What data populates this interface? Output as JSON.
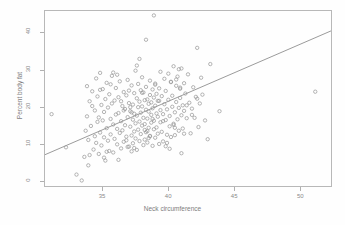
{
  "chart_data": {
    "type": "scatter",
    "title": "",
    "xlabel": "Neck circumference",
    "ylabel": "Percent body fat",
    "xlim": [
      30.6,
      52.4
    ],
    "ylim": [
      -1.5,
      46.0
    ],
    "xticks": [
      35,
      40,
      45,
      50
    ],
    "yticks": [
      0,
      10,
      20,
      30,
      40
    ],
    "grid": false,
    "legend": null,
    "point_style": {
      "marker": "open-circle",
      "radius": 1.7,
      "color": "#9a9a9a",
      "fill": "none"
    },
    "fit_line": {
      "type": "linear-regression",
      "color": "#808080",
      "width": 0.8,
      "x_start": 30.6,
      "y_start": 7.0,
      "x_end": 52.4,
      "y_end": 40.6
    },
    "x": [
      31.1,
      32.2,
      33.0,
      33.4,
      33.6,
      33.7,
      33.8,
      33.8,
      33.9,
      34.0,
      34.0,
      34.1,
      34.2,
      34.3,
      34.4,
      34.4,
      34.5,
      34.5,
      34.6,
      34.6,
      34.7,
      34.7,
      34.8,
      34.8,
      34.9,
      34.9,
      35.0,
      35.0,
      35.1,
      35.1,
      35.2,
      35.2,
      35.3,
      35.3,
      35.4,
      35.4,
      35.5,
      35.5,
      35.6,
      35.6,
      35.7,
      35.7,
      35.8,
      35.8,
      35.9,
      35.9,
      36.0,
      36.0,
      36.1,
      36.1,
      36.2,
      36.2,
      36.3,
      36.3,
      36.4,
      36.4,
      36.5,
      36.5,
      36.6,
      36.6,
      36.7,
      36.7,
      36.8,
      36.8,
      36.9,
      36.9,
      37.0,
      37.0,
      37.1,
      37.1,
      37.2,
      37.2,
      37.2,
      37.3,
      37.3,
      37.3,
      37.4,
      37.4,
      37.4,
      37.5,
      37.5,
      37.5,
      37.6,
      37.6,
      37.6,
      37.7,
      37.7,
      37.7,
      37.8,
      37.8,
      37.8,
      37.9,
      37.9,
      37.9,
      38.0,
      38.0,
      38.0,
      38.1,
      38.1,
      38.1,
      38.2,
      38.2,
      38.2,
      38.3,
      38.3,
      38.3,
      38.4,
      38.4,
      38.4,
      38.5,
      38.5,
      38.5,
      38.6,
      38.6,
      38.6,
      38.7,
      38.7,
      38.7,
      38.8,
      38.8,
      38.8,
      38.9,
      38.9,
      38.9,
      39.0,
      39.0,
      39.0,
      39.1,
      39.1,
      39.1,
      39.2,
      39.2,
      39.2,
      39.3,
      39.3,
      39.4,
      39.4,
      39.5,
      39.5,
      39.6,
      39.6,
      39.7,
      39.7,
      39.8,
      39.8,
      39.9,
      39.9,
      40.0,
      40.0,
      40.1,
      40.1,
      40.2,
      40.2,
      40.3,
      40.3,
      40.4,
      40.4,
      40.5,
      40.5,
      40.6,
      40.6,
      40.7,
      40.7,
      40.8,
      40.8,
      40.9,
      40.9,
      41.0,
      41.0,
      41.1,
      41.1,
      41.2,
      41.2,
      41.3,
      41.4,
      41.5,
      41.6,
      41.7,
      41.8,
      41.9,
      42.0,
      42.1,
      42.2,
      42.3,
      42.4,
      42.5,
      42.6,
      42.8,
      43.0,
      43.2,
      43.9,
      51.2,
      34.2,
      35.6,
      36.4,
      37.1,
      37.8,
      38.3,
      38.9,
      39.4,
      40.2,
      40.8,
      36.2,
      37.4,
      38.6,
      39.8,
      41.0,
      35.1,
      36.8,
      38.2,
      39.6,
      40.5,
      33.9,
      35.3,
      36.9,
      38.5,
      40.1,
      41.4,
      34.8,
      36.1,
      37.6,
      39.0,
      40.4,
      41.8,
      36.6,
      38.0,
      39.3,
      40.9,
      42.2,
      37.2,
      38.8,
      40.6,
      35.8,
      37.0,
      38.4,
      39.9,
      41.2
    ],
    "y": [
      18.0,
      9.0,
      1.6,
      0.0,
      6.4,
      13.5,
      25.6,
      17.4,
      11.0,
      21.5,
      6.9,
      14.8,
      24.2,
      8.4,
      19.0,
      12.0,
      27.7,
      10.2,
      15.9,
      22.8,
      7.2,
      17.1,
      29.2,
      13.0,
      20.5,
      9.5,
      16.3,
      24.8,
      11.7,
      18.6,
      5.4,
      22.1,
      14.2,
      26.5,
      10.8,
      19.8,
      8.0,
      23.4,
      16.7,
      12.5,
      20.9,
      28.4,
      7.6,
      15.2,
      21.7,
      11.3,
      17.9,
      25.1,
      9.8,
      14.0,
      22.6,
      18.3,
      12.9,
      26.9,
      8.7,
      16.1,
      20.2,
      13.6,
      24.0,
      10.5,
      19.4,
      15.0,
      23.1,
      11.9,
      17.2,
      27.3,
      9.2,
      21.0,
      14.6,
      18.8,
      25.8,
      12.2,
      7.9,
      20.6,
      16.5,
      10.1,
      23.7,
      13.3,
      18.1,
      29.8,
      15.5,
      11.4,
      22.3,
      17.6,
      8.3,
      19.9,
      26.2,
      13.8,
      21.4,
      16.0,
      10.7,
      24.5,
      18.4,
      12.6,
      20.1,
      14.9,
      28.0,
      17.0,
      23.9,
      9.6,
      21.8,
      15.3,
      11.1,
      19.2,
      25.4,
      13.1,
      22.0,
      16.8,
      10.3,
      20.8,
      18.7,
      14.3,
      27.1,
      12.1,
      23.2,
      17.8,
      21.2,
      15.7,
      9.4,
      19.6,
      24.7,
      13.9,
      22.5,
      16.2,
      11.6,
      26.0,
      20.3,
      14.4,
      18.2,
      23.5,
      12.7,
      21.6,
      17.3,
      9.9,
      25.0,
      19.1,
      15.8,
      13.2,
      22.9,
      18.0,
      10.6,
      27.6,
      20.7,
      16.4,
      24.3,
      12.4,
      19.3,
      29.0,
      21.9,
      14.7,
      17.5,
      26.7,
      11.8,
      23.0,
      20.0,
      15.1,
      31.0,
      18.5,
      12.3,
      25.7,
      21.3,
      16.6,
      28.2,
      19.7,
      13.5,
      24.9,
      22.4,
      17.7,
      30.4,
      20.4,
      14.1,
      26.4,
      18.9,
      23.6,
      16.9,
      28.8,
      21.1,
      12.8,
      19.5,
      25.3,
      17.0,
      22.7,
      36.0,
      14.5,
      20.9,
      27.9,
      23.3,
      16.3,
      11.2,
      31.6,
      18.8,
      24.1,
      20.2,
      26.1,
      21.5,
      19.9,
      33.0,
      38.2,
      44.8,
      29.5,
      26.8,
      30.2,
      5.6,
      8.8,
      12.0,
      9.3,
      7.4,
      6.2,
      10.9,
      13.7,
      16.1,
      14.3,
      4.1,
      7.8,
      9.1,
      11.5,
      8.6,
      20.4,
      24.6,
      28.7,
      31.2,
      26.3,
      15.4,
      17.8,
      19.0,
      23.8,
      21.6,
      25.2,
      22.2,
      18.5,
      16.7,
      27.4,
      29.3,
      24.4,
      13.4,
      10.2,
      12.7,
      15.6,
      11.8,
      30.8,
      32.4,
      33.5,
      22.0,
      20.6,
      17.4,
      19.8,
      23.2
    ]
  }
}
